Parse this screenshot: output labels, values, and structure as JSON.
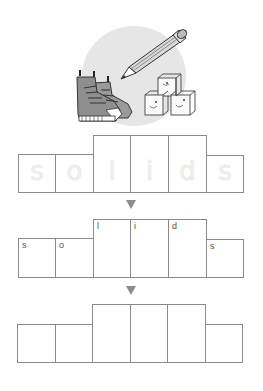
{
  "illustration": {
    "items": [
      "boots",
      "pencil",
      "blocks"
    ],
    "background_color": "#e6e6e6"
  },
  "word": "solids",
  "rows": [
    {
      "name": "tracing-row",
      "style": "faint-tracing",
      "cells": [
        {
          "letter": "s",
          "tall": false
        },
        {
          "letter": "o",
          "tall": false
        },
        {
          "letter": "l",
          "tall": true
        },
        {
          "letter": "i",
          "tall": true
        },
        {
          "letter": "d",
          "tall": true
        },
        {
          "letter": "s",
          "tall": false
        }
      ]
    },
    {
      "name": "labeled-row",
      "style": "corner-letters",
      "cells": [
        {
          "letter": "s",
          "tall": false
        },
        {
          "letter": "o",
          "tall": false
        },
        {
          "letter": "l",
          "tall": true
        },
        {
          "letter": "i",
          "tall": true
        },
        {
          "letter": "d",
          "tall": true
        },
        {
          "letter": "s",
          "tall": false
        }
      ]
    },
    {
      "name": "blank-row",
      "style": "empty",
      "cells": [
        {
          "letter": "",
          "tall": false
        },
        {
          "letter": "",
          "tall": false
        },
        {
          "letter": "",
          "tall": true
        },
        {
          "letter": "",
          "tall": true
        },
        {
          "letter": "",
          "tall": true
        },
        {
          "letter": "",
          "tall": false
        }
      ]
    }
  ],
  "arrows": [
    "down-arrow",
    "down-arrow"
  ],
  "colors": {
    "box_border": "#8a8a8a",
    "arrow": "#8c8c8c",
    "letter": "#555555"
  }
}
